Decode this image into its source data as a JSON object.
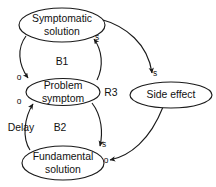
{
  "diagram": {
    "type": "causal-loop-diagram",
    "background_color": "#ffffff",
    "stroke_color": "#1a1a1a",
    "text_color": "#111111",
    "nodes": [
      {
        "id": "symptomatic-solution",
        "line1": "Symptomatic",
        "line2": "solution",
        "cx": 62,
        "cy": 25,
        "rx": 43,
        "ry": 17
      },
      {
        "id": "problem-symptom",
        "line1": "Problem",
        "line2": "symptom",
        "cx": 63,
        "cy": 92,
        "rx": 37,
        "ry": 13.5
      },
      {
        "id": "fundamental-solution",
        "line1": "Fundamental",
        "line2": "solution",
        "cx": 63,
        "cy": 163,
        "rx": 41,
        "ry": 17
      },
      {
        "id": "side-effect",
        "line1": "Side effect",
        "line2": "",
        "cx": 171,
        "cy": 95,
        "rx": 41,
        "ry": 13
      }
    ],
    "polarity_labels": [
      {
        "id": "s-symptomatic-in",
        "text": "s",
        "x": 97,
        "y": 38
      },
      {
        "id": "o-problem-upper",
        "text": "o",
        "x": 19,
        "y": 78
      },
      {
        "id": "o-problem-lower",
        "text": "o",
        "x": 19,
        "y": 102
      },
      {
        "id": "s-fundamental-in",
        "text": "s",
        "x": 104,
        "y": 145
      },
      {
        "id": "o-fundamental-side",
        "text": "o",
        "x": 106,
        "y": 161
      },
      {
        "id": "s-side-effect-in",
        "text": "s",
        "x": 155,
        "y": 74
      }
    ],
    "loop_labels": [
      {
        "id": "loop-b1",
        "text": "B1",
        "x": 62,
        "y": 62
      },
      {
        "id": "loop-b2",
        "text": "B2",
        "x": 60,
        "y": 128
      },
      {
        "id": "loop-r3",
        "text": "R3",
        "x": 111,
        "y": 93
      }
    ],
    "annotations": [
      {
        "id": "delay-annotation",
        "text": "Delay",
        "x": 21,
        "y": 128
      }
    ]
  }
}
